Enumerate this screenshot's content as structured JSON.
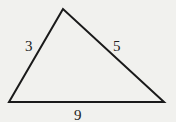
{
  "diagram": {
    "type": "triangle",
    "vertices": {
      "top": [
        63,
        9
      ],
      "bottom_left": [
        9,
        102
      ],
      "bottom_right": [
        164,
        102
      ]
    },
    "sides": [
      {
        "name": "left",
        "label": "3"
      },
      {
        "name": "right",
        "label": "5"
      },
      {
        "name": "base",
        "label": "9"
      }
    ],
    "stroke_color": "#1a1a1a",
    "background_color": "#f1f1ee"
  }
}
